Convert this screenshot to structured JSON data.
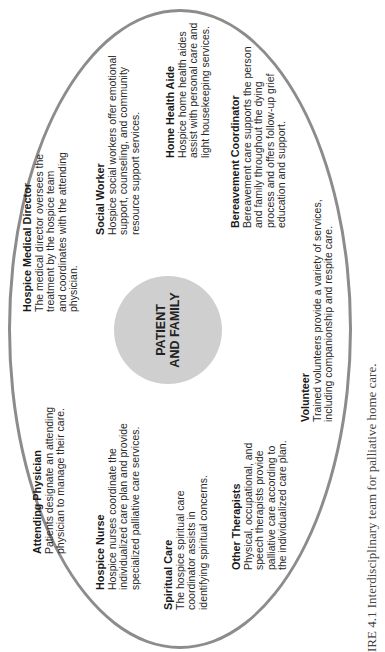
{
  "diagram": {
    "center": {
      "line1": "PATIENT",
      "line2": "AND FAMILY",
      "color": "#cfcfcf"
    },
    "ellipse_color": "#8c8c8c",
    "roles": [
      {
        "title": "Attending Physician",
        "lines": [
          "Patients designate an attending",
          "physician to manage their care."
        ]
      },
      {
        "title": "Hospice Medical Director",
        "lines": [
          "The medical director oversees the",
          "treatment by the hospice team",
          "and coordinates with the attending",
          "physician."
        ]
      },
      {
        "title": "Hospice Nurse",
        "lines": [
          "Hospice nurses coordinate the",
          "individualized care plan and provide",
          "specialized palliative care services."
        ]
      },
      {
        "title": "Social Worker",
        "lines": [
          "Hospice social workers offer emotional",
          "support, counseling, and community",
          "resource support services."
        ]
      },
      {
        "title": "Spiritual Care",
        "lines": [
          "The hospice spiritual care",
          "coordinator assists in",
          "identifying spiritual concerns."
        ]
      },
      {
        "title": "Home Health Aide",
        "lines": [
          "Hospice home health aides",
          "assist with personal care and",
          "light housekeeping services."
        ]
      },
      {
        "title": "Other Therapists",
        "lines": [
          "Physical, occupational, and",
          "speech therapists provide",
          "palliative care according to",
          "the individualized care plan."
        ]
      },
      {
        "title": "Bereavement Coordinator",
        "lines": [
          "Bereavement care supports the person",
          "and family throughout the dying",
          "process and offers follow-up grief",
          "education and support."
        ]
      },
      {
        "title": "Volunteer",
        "lines": [
          "Trained volunteers provide a variety of services,",
          "including companionship and respite care."
        ]
      }
    ],
    "caption": "IRE 4.1 Interdisciplinary team for palliative home care."
  }
}
